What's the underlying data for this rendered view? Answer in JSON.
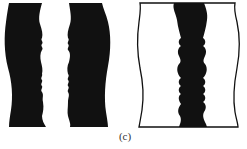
{
  "figure": {
    "caption": "(c)",
    "colors": {
      "ink": "#111111",
      "paper": "#ffffff"
    },
    "panels": [
      {
        "name": "left-vase",
        "description": "Solid black vase with a white wavy central column"
      },
      {
        "name": "right-vase",
        "description": "Outlined vase with a black wavy central column"
      }
    ]
  }
}
